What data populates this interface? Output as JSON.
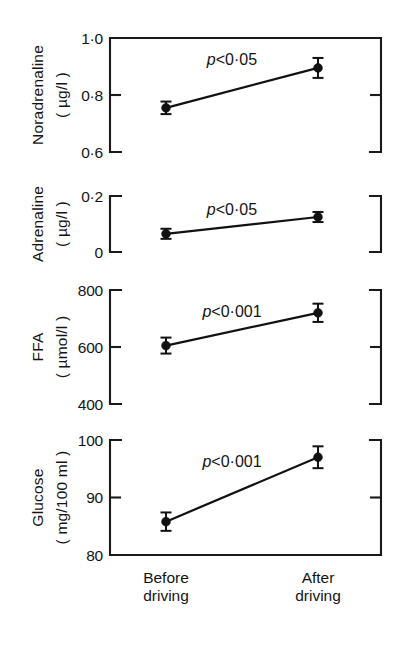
{
  "figure": {
    "background": "#ffffff",
    "ink_color": "#111111"
  },
  "x_axis": {
    "categories": [
      {
        "line1": "Before",
        "line2": "driving"
      },
      {
        "line1": "After",
        "line2": "driving"
      }
    ]
  },
  "chart_data": {
    "type": "line",
    "title": "",
    "subtitle": "",
    "xlabel": "",
    "grid": false,
    "legend": "none",
    "x": [
      "Before driving",
      "After driving"
    ],
    "panels": [
      {
        "ylabel_line1": "Noradrenaline",
        "ylabel_line2": "( µg/l )",
        "ylabel_plain": "Noradrenaline (µg/l)",
        "ylim": [
          0.6,
          1.0
        ],
        "ticks": [
          "1·0",
          "0·8",
          "0·6"
        ],
        "tick_values": [
          1.0,
          0.8,
          0.6
        ],
        "values": [
          0.755,
          0.895
        ],
        "errors": [
          0.022,
          0.035
        ],
        "annotation": "p<0·05",
        "annotation_p": "p",
        "annotation_rest": "<0·05",
        "has_top_axis": true,
        "has_bottom_axis": false
      },
      {
        "ylabel_line1": "Adrenaline",
        "ylabel_line2": "( µg/l )",
        "ylabel_plain": "Adrenaline (µg/l)",
        "ylim": [
          0,
          0.2
        ],
        "ticks": [
          "0·2",
          "0"
        ],
        "tick_values": [
          0.2,
          0
        ],
        "values": [
          0.065,
          0.125
        ],
        "errors": [
          0.018,
          0.018
        ],
        "annotation": "p<0·05",
        "annotation_p": "p",
        "annotation_rest": "<0·05",
        "has_top_axis": false,
        "has_bottom_axis": false
      },
      {
        "ylabel_line1": "FFA",
        "ylabel_line2": "( µmol/l )",
        "ylabel_plain": "FFA (µmol/l)",
        "ylim": [
          400,
          800
        ],
        "ticks": [
          "800",
          "600",
          "400"
        ],
        "tick_values": [
          800,
          600,
          400
        ],
        "values": [
          605,
          720
        ],
        "errors": [
          28,
          32
        ],
        "annotation": "p<0·001",
        "annotation_p": "p",
        "annotation_rest": "<0·001",
        "has_top_axis": false,
        "has_bottom_axis": false
      },
      {
        "ylabel_line1": "Glucose",
        "ylabel_line2": "( mg/100 ml )",
        "ylabel_plain": "Glucose (mg/100 ml)",
        "ylim": [
          80,
          100
        ],
        "ticks": [
          "100",
          "90",
          "80"
        ],
        "tick_values": [
          100,
          90,
          80
        ],
        "values": [
          85.8,
          97.0
        ],
        "errors": [
          1.6,
          1.9
        ],
        "annotation": "p<0·001",
        "annotation_p": "p",
        "annotation_rest": "<0·001",
        "has_top_axis": false,
        "has_bottom_axis": true
      }
    ]
  }
}
